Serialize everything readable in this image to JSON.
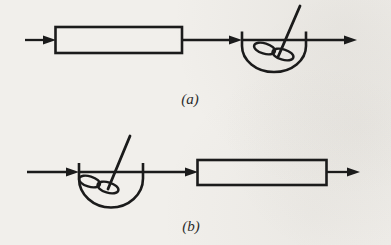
{
  "figure": {
    "panels": [
      {
        "label": "(a)",
        "components": [
          "flow-in-arrow",
          "plug-flow-reactor",
          "connector-arrow",
          "stirred-tank-reactor",
          "flow-out-arrow"
        ]
      },
      {
        "label": "(b)",
        "components": [
          "flow-in-arrow",
          "stirred-tank-reactor",
          "connector-arrow",
          "plug-flow-reactor",
          "flow-out-arrow"
        ]
      }
    ],
    "colors": {
      "ink": "#1b1b1b",
      "paper": "#f1efeb"
    }
  }
}
